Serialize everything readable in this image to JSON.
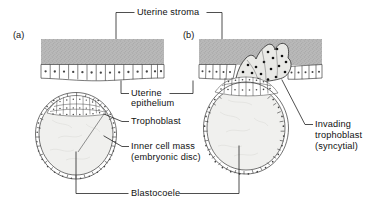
{
  "figure": {
    "title_implicit": "Implantation of the blastocyst in the uterine wall",
    "panels": [
      {
        "id": "a",
        "label": "(a)"
      },
      {
        "id": "b",
        "label": "(b)"
      }
    ],
    "labels": {
      "uterine_stroma": "Uterine stroma",
      "uterine_epithelium_line1": "Uterine",
      "uterine_epithelium_line2": "epithelium",
      "trophoblast": "Trophoblast",
      "inner_cell_mass_line1": "Inner cell mass",
      "inner_cell_mass_line2": "(embryonic disc)",
      "blastocoele": "Blastocoele",
      "invading_line1": "Invading",
      "invading_line2": "trophoblast",
      "invading_line3": "(syncytial)"
    },
    "colors": {
      "stroma_fill": "#b9b9b9",
      "stroma_stipple": "#8e8e8e",
      "ink": "#111111",
      "leader": "#222222",
      "cell_fill": "#ffffff",
      "cavity_fill": "#f0f0ee",
      "background": "#ffffff"
    },
    "structures": [
      "uterine stroma",
      "uterine epithelium",
      "trophoblast",
      "inner cell mass (embryonic disc)",
      "blastocoele",
      "invading trophoblast (syncytial)"
    ]
  }
}
